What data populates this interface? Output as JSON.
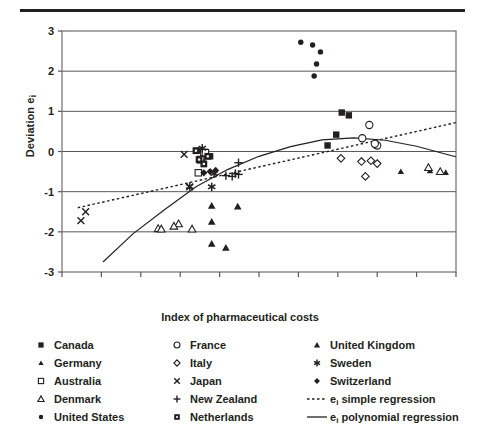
{
  "chart_data": {
    "type": "scatter",
    "title": "",
    "xlabel": "Index of pharmaceutical costs",
    "ylabel": "Deviation e",
    "ylabel_sub": "i",
    "xlim": [
      -2.5,
      2.5
    ],
    "ylim": [
      -3,
      3
    ],
    "xticks": [
      "-2.5",
      "-2.0",
      "-1.5",
      "-1.0",
      "-0.5",
      "0.0",
      "0.5",
      "1.0",
      "1.5",
      "2.0",
      "2.5"
    ],
    "xtick_values": [
      -2.5,
      -2.0,
      -1.5,
      -1.0,
      -0.5,
      0.0,
      0.5,
      1.0,
      1.5,
      2.0,
      2.5
    ],
    "yticks": [
      "3",
      "2",
      "1",
      "0",
      "-1",
      "-2",
      "-3"
    ],
    "ytick_values": [
      3,
      2,
      1,
      0,
      -1,
      -2,
      -3
    ],
    "grid": "horizontal",
    "legend_position": "below",
    "series": [
      {
        "name": "Canada",
        "marker": "filled-square",
        "points": [
          [
            -0.78,
            0.02
          ],
          [
            -0.62,
            -0.12
          ],
          [
            -0.72,
            -0.2
          ],
          [
            -0.75,
            -0.22
          ],
          [
            0.98,
            0.42
          ],
          [
            0.87,
            0.15
          ],
          [
            1.05,
            0.97
          ],
          [
            1.14,
            0.9
          ]
        ]
      },
      {
        "name": "Germany",
        "marker": "filled-triangle-small",
        "points": [
          [
            2.15,
            -0.4
          ],
          [
            2.17,
            -0.48
          ],
          [
            2.3,
            -0.5
          ],
          [
            2.37,
            -0.52
          ],
          [
            1.8,
            -0.5
          ]
        ]
      },
      {
        "name": "Australia",
        "marker": "open-square",
        "points": [
          [
            -0.7,
            -0.02
          ],
          [
            -0.74,
            -0.2
          ],
          [
            -0.68,
            -0.03
          ],
          [
            -0.77,
            -0.53
          ]
        ]
      },
      {
        "name": "Denmark",
        "marker": "open-triangle",
        "points": [
          [
            -1.28,
            -1.92
          ],
          [
            -1.24,
            -1.93
          ],
          [
            -1.02,
            -1.8
          ],
          [
            -1.08,
            -1.86
          ],
          [
            -0.85,
            -1.93
          ],
          [
            2.15,
            -0.4
          ],
          [
            2.3,
            -0.5
          ]
        ]
      },
      {
        "name": "United States",
        "marker": "filled-circle-small",
        "points": [
          [
            0.53,
            2.72
          ],
          [
            0.68,
            2.65
          ],
          [
            0.78,
            2.48
          ],
          [
            0.73,
            2.18
          ],
          [
            0.7,
            1.88
          ]
        ]
      },
      {
        "name": "France",
        "marker": "open-circle",
        "points": [
          [
            1.4,
            0.66
          ],
          [
            1.31,
            0.33
          ],
          [
            1.48,
            0.17
          ],
          [
            1.5,
            0.15
          ],
          [
            1.47,
            0.19
          ]
        ]
      },
      {
        "name": "Italy",
        "marker": "open-diamond",
        "points": [
          [
            1.04,
            -0.17
          ],
          [
            1.3,
            -0.25
          ],
          [
            1.42,
            -0.23
          ],
          [
            1.5,
            -0.3
          ],
          [
            1.35,
            -0.62
          ]
        ]
      },
      {
        "name": "Japan",
        "marker": "cross-x",
        "points": [
          [
            -2.2,
            -1.5
          ],
          [
            -2.26,
            -1.72
          ],
          [
            -0.95,
            -0.07
          ],
          [
            -0.88,
            -0.88
          ]
        ]
      },
      {
        "name": "New Zealand",
        "marker": "plus",
        "points": [
          [
            -0.42,
            -0.6
          ],
          [
            -0.34,
            -0.62
          ],
          [
            -0.3,
            -0.55
          ],
          [
            -0.26,
            -0.57
          ],
          [
            -0.26,
            -0.28
          ]
        ]
      },
      {
        "name": "Netherlands",
        "marker": "filled-square-dot",
        "points": [
          [
            -0.8,
            0.02
          ],
          [
            -0.65,
            -0.12
          ],
          [
            -0.7,
            -0.31
          ],
          [
            -0.76,
            -0.2
          ]
        ]
      },
      {
        "name": "United Kingdom",
        "marker": "filled-triangle",
        "points": [
          [
            -0.6,
            -1.35
          ],
          [
            -0.27,
            -1.37
          ],
          [
            -0.6,
            -1.75
          ],
          [
            -0.6,
            -2.3
          ],
          [
            -0.42,
            -2.4
          ]
        ]
      },
      {
        "name": "Sweden",
        "marker": "asterisk",
        "points": [
          [
            -0.72,
            0.08
          ],
          [
            -0.88,
            -0.87
          ],
          [
            -0.6,
            -0.88
          ],
          [
            -0.57,
            -0.55
          ]
        ]
      },
      {
        "name": "Switzerland",
        "marker": "filled-diamond",
        "points": [
          [
            -0.7,
            -0.53
          ],
          [
            -0.55,
            -0.47
          ],
          [
            -0.62,
            -0.5
          ]
        ]
      }
    ],
    "fits": [
      {
        "name": "e_i simple regression",
        "style": "dotted",
        "kind": "linear",
        "points": [
          [
            -2.3,
            -1.4
          ],
          [
            2.5,
            0.72
          ]
        ]
      },
      {
        "name": "e_i polynomial regression",
        "style": "solid",
        "kind": "quadratic",
        "points": [
          [
            -1.98,
            -2.75
          ],
          [
            -1.6,
            -2.05
          ],
          [
            -1.2,
            -1.45
          ],
          [
            -0.8,
            -0.88
          ],
          [
            -0.4,
            -0.45
          ],
          [
            0.0,
            -0.12
          ],
          [
            0.4,
            0.12
          ],
          [
            0.8,
            0.29
          ],
          [
            1.2,
            0.34
          ],
          [
            1.6,
            0.28
          ],
          [
            2.0,
            0.13
          ],
          [
            2.4,
            -0.08
          ],
          [
            2.5,
            -0.13
          ]
        ]
      }
    ]
  },
  "legend": {
    "columns": [
      [
        {
          "marker": "filled-square",
          "label": "Canada"
        },
        {
          "marker": "filled-triangle-small",
          "label": "Germany"
        },
        {
          "marker": "open-square",
          "label": "Australia"
        },
        {
          "marker": "open-triangle",
          "label": "Denmark"
        },
        {
          "marker": "filled-circle-small",
          "label": "United States"
        }
      ],
      [
        {
          "marker": "open-circle",
          "label": "France"
        },
        {
          "marker": "open-diamond",
          "label": "Italy"
        },
        {
          "marker": "cross-x",
          "label": "Japan"
        },
        {
          "marker": "plus",
          "label": "New Zealand"
        },
        {
          "marker": "filled-square-dot",
          "label": "Netherlands"
        }
      ],
      [
        {
          "marker": "filled-triangle",
          "label": "United Kingdom"
        },
        {
          "marker": "asterisk",
          "label": "Sweden"
        },
        {
          "marker": "filled-diamond",
          "label": "Switzerland"
        },
        {
          "marker": "line-dotted",
          "label": "e_i simple regression",
          "label_pre": "e",
          "label_sub": "i",
          "label_post": " simple regression"
        },
        {
          "marker": "line-solid",
          "label": "e_i polynomial regression",
          "label_pre": "e",
          "label_sub": "i",
          "label_post": " polynomial regression"
        }
      ]
    ]
  },
  "colors": {
    "ink": "#231f20",
    "grid": "#58595b",
    "frame": "#6d6e71"
  }
}
